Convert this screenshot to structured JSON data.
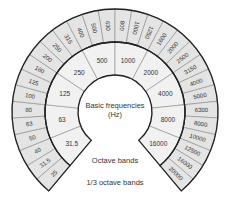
{
  "diagram": {
    "center": {
      "x": 115,
      "y": 112
    },
    "start_angle_deg": 130,
    "sweep_deg": 280,
    "radii": {
      "hole": 37,
      "octave_outer": 70,
      "third_outer": 103
    },
    "colors": {
      "third_octave_fill": "#e4e4e4",
      "octave_fill": "#f1f1f1",
      "outline": "#222222",
      "divider": "#8a8a8a",
      "text": "#333333"
    },
    "center_label": {
      "line1": "Basic frequencies",
      "line2": "(Hz)"
    },
    "octave_label": "Octave bands",
    "third_octave_label": "1/3 octave bands",
    "octave_bands": [
      "31.5",
      "63",
      "125",
      "250",
      "500",
      "1000",
      "2000",
      "4000",
      "8000",
      "16000"
    ],
    "third_octave_bands": [
      "25",
      "31.5",
      "40",
      "50",
      "63",
      "80",
      "100",
      "125",
      "160",
      "200",
      "250",
      "315",
      "400",
      "500",
      "630",
      "800",
      "1000",
      "1250",
      "1600",
      "2000",
      "2500",
      "3150",
      "4000",
      "5000",
      "6300",
      "8000",
      "10000",
      "12500",
      "16000",
      "20000"
    ]
  }
}
